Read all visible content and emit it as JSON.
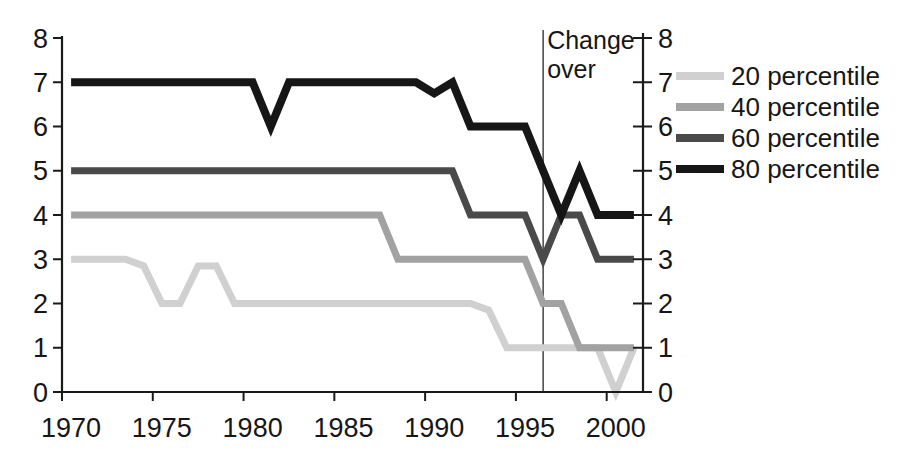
{
  "chart_data": {
    "type": "line",
    "title": "",
    "xlabel": "",
    "ylabel": "",
    "ylim": [
      0,
      8
    ],
    "grid": false,
    "legend_position": "right",
    "axes_color": "#1a1a1a",
    "text_color": "#161616",
    "x": [
      1970,
      1971,
      1972,
      1973,
      1974,
      1975,
      1976,
      1977,
      1978,
      1979,
      1980,
      1981,
      1982,
      1983,
      1984,
      1985,
      1986,
      1987,
      1988,
      1989,
      1990,
      1991,
      1992,
      1993,
      1994,
      1995,
      1996,
      1997,
      1998,
      1999,
      2000,
      2001
    ],
    "x_tick_labels": [
      "1970",
      "1975",
      "1980",
      "1985",
      "1990",
      "1995",
      "2000"
    ],
    "y_ticks": [
      0,
      1,
      2,
      3,
      4,
      5,
      6,
      7,
      8
    ],
    "y_axis_sides": [
      "left",
      "right"
    ],
    "series": [
      {
        "name": "20 percentile",
        "color": "#d0d0d0",
        "stroke_width": 7,
        "values": [
          3,
          3,
          3,
          3,
          2.85,
          2,
          2,
          2.85,
          2.85,
          2,
          2,
          2,
          2,
          2,
          2,
          2,
          2,
          2,
          2,
          2,
          2,
          2,
          2,
          1.85,
          1,
          1,
          1,
          1,
          1,
          1,
          0,
          1
        ]
      },
      {
        "name": "40 percentile",
        "color": "#a2a2a2",
        "stroke_width": 7,
        "values": [
          4,
          4,
          4,
          4,
          4,
          4,
          4,
          4,
          4,
          4,
          4,
          4,
          4,
          4,
          4,
          4,
          4,
          4,
          3,
          3,
          3,
          3,
          3,
          3,
          3,
          3,
          2,
          2,
          1,
          1,
          1,
          1
        ]
      },
      {
        "name": "60 percentile",
        "color": "#4a4a4a",
        "stroke_width": 7,
        "values": [
          5,
          5,
          5,
          5,
          5,
          5,
          5,
          5,
          5,
          5,
          5,
          5,
          5,
          5,
          5,
          5,
          5,
          5,
          5,
          5,
          5,
          5,
          4,
          4,
          4,
          4,
          3,
          4,
          4,
          3,
          3,
          3
        ]
      },
      {
        "name": "80 percentile",
        "color": "#161616",
        "stroke_width": 8,
        "values": [
          7,
          7,
          7,
          7,
          7,
          7,
          7,
          7,
          7,
          7,
          7,
          6,
          7,
          7,
          7,
          7,
          7,
          7,
          7,
          7,
          6.75,
          7,
          6,
          6,
          6,
          6,
          5,
          4,
          5,
          4,
          4,
          4
        ]
      }
    ],
    "annotation": {
      "lines": [
        "Change",
        "over"
      ],
      "year": 1996,
      "line_color": "#444444"
    }
  }
}
